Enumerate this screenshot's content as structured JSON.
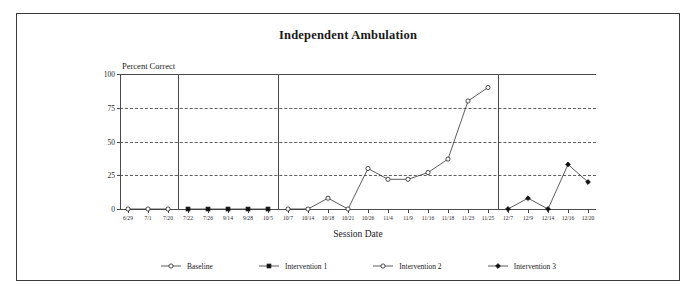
{
  "figure": {
    "title": "Independent Ambulation"
  },
  "chart_data": {
    "type": "line",
    "title": "Independent Ambulation",
    "xlabel": "Session Date",
    "ylabel": "Percent Correct",
    "ylim": [
      0,
      100
    ],
    "yticks": [
      0,
      25,
      50,
      75,
      100
    ],
    "grid": "horizontal-dashed",
    "legend_position": "bottom",
    "categories": [
      "6/29",
      "7/1",
      "7/20",
      "7/22",
      "7/26",
      "9/14",
      "9/28",
      "10/5",
      "10/7",
      "10/14",
      "10/18",
      "10/21",
      "10/26",
      "11/4",
      "11/9",
      "11/16",
      "11/18",
      "11/23",
      "11/25",
      "12/7",
      "12/9",
      "12/14",
      "12/16",
      "12/20"
    ],
    "phase_dividers_after": [
      "7/20",
      "10/5",
      "11/25"
    ],
    "series": [
      {
        "name": "Baseline",
        "marker": "open-circle",
        "x": [
          "6/29",
          "7/1",
          "7/20"
        ],
        "values": [
          0,
          0,
          0
        ]
      },
      {
        "name": "Intervention 1",
        "marker": "filled-square",
        "x": [
          "7/22",
          "7/26",
          "9/14",
          "9/28",
          "10/5"
        ],
        "values": [
          0,
          0,
          0,
          0,
          0
        ]
      },
      {
        "name": "Intervention 2",
        "marker": "open-circle",
        "x": [
          "10/7",
          "10/14",
          "10/18",
          "10/21",
          "10/26",
          "11/4",
          "11/9",
          "11/16",
          "11/18",
          "11/23",
          "11/25"
        ],
        "values": [
          0,
          0,
          8,
          0,
          30,
          22,
          22,
          27,
          37,
          80,
          90
        ]
      },
      {
        "name": "Intervention 3",
        "marker": "filled-diamond",
        "x": [
          "12/7",
          "12/9",
          "12/14",
          "12/16",
          "12/20"
        ],
        "values": [
          0,
          8,
          0,
          33,
          20
        ]
      }
    ]
  },
  "legend": [
    {
      "label": "Baseline",
      "marker": "open-circle"
    },
    {
      "label": "Intervention 1",
      "marker": "filled-square"
    },
    {
      "label": "Intervention 2",
      "marker": "open-circle"
    },
    {
      "label": "Intervention 3",
      "marker": "filled-diamond"
    }
  ],
  "colors": {
    "line": "#333333",
    "axis": "#4a4a4a",
    "grid": "#5e5e5e",
    "frame": "#3a3a3a",
    "marker_fill": "#111111",
    "marker_open": "#ffffff"
  }
}
